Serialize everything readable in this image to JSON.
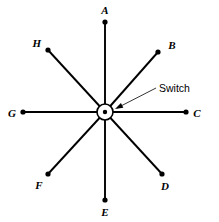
{
  "figure": {
    "canvas": {
      "width": 219,
      "height": 222,
      "background": "#ffffff"
    },
    "stroke_color": "#000000",
    "center": {
      "x": 105,
      "y": 112,
      "outer_radius": 8,
      "inner_dot_radius": 2.2,
      "label": "Switch"
    },
    "spokes": [
      {
        "id": "A",
        "label": "A",
        "end": {
          "x": 105,
          "y": 22
        },
        "label_pos": {
          "x": 105,
          "y": 10
        },
        "dot_radius": 2.6
      },
      {
        "id": "B",
        "label": "B",
        "end": {
          "x": 158,
          "y": 52
        },
        "label_pos": {
          "x": 172,
          "y": 45
        },
        "dot_radius": 2.6
      },
      {
        "id": "C",
        "label": "C",
        "end": {
          "x": 186,
          "y": 112
        },
        "label_pos": {
          "x": 197,
          "y": 113
        },
        "dot_radius": 2.6
      },
      {
        "id": "D",
        "label": "D",
        "end": {
          "x": 162,
          "y": 174
        },
        "label_pos": {
          "x": 165,
          "y": 186
        },
        "dot_radius": 2.6
      },
      {
        "id": "E",
        "label": "E",
        "end": {
          "x": 105,
          "y": 200
        },
        "label_pos": {
          "x": 105,
          "y": 212
        },
        "dot_radius": 2.6
      },
      {
        "id": "F",
        "label": "F",
        "end": {
          "x": 48,
          "y": 174
        },
        "label_pos": {
          "x": 39,
          "y": 185
        },
        "dot_radius": 2.6
      },
      {
        "id": "G",
        "label": "G",
        "end": {
          "x": 23,
          "y": 112
        },
        "label_pos": {
          "x": 12,
          "y": 113
        },
        "dot_radius": 2.6
      },
      {
        "id": "H",
        "label": "H",
        "end": {
          "x": 48,
          "y": 50
        },
        "label_pos": {
          "x": 37,
          "y": 43
        },
        "dot_radius": 2.6
      }
    ],
    "callout": {
      "text": "Switch",
      "text_pos": {
        "x": 159,
        "y": 88
      },
      "leader_from": {
        "x": 156,
        "y": 88
      },
      "leader_to": {
        "x": 117,
        "y": 108
      },
      "arrow_tip": {
        "x": 115,
        "y": 109
      }
    }
  }
}
